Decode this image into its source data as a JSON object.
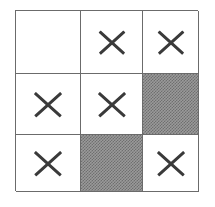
{
  "diagram": {
    "type": "grid",
    "rows": 3,
    "columns": 3,
    "colors": {
      "background": "#ffffff",
      "grid_line": "#6b6b6b",
      "cell_fill": "#ffffff",
      "shaded_fill": "#9a9a9a",
      "shaded_pattern": "#6f6f6f",
      "mark_color": "#3a3a3a"
    },
    "legend": {
      "empty_label": "empty",
      "cross_label": "X",
      "shaded_label": "shaded"
    },
    "cells": [
      {
        "row": 1,
        "col": 1,
        "state": "empty",
        "mark": ""
      },
      {
        "row": 1,
        "col": 2,
        "state": "cross",
        "mark": "X"
      },
      {
        "row": 1,
        "col": 3,
        "state": "cross",
        "mark": "X"
      },
      {
        "row": 2,
        "col": 1,
        "state": "cross",
        "mark": "X"
      },
      {
        "row": 2,
        "col": 2,
        "state": "cross",
        "mark": "X"
      },
      {
        "row": 2,
        "col": 3,
        "state": "shaded",
        "mark": ""
      },
      {
        "row": 3,
        "col": 1,
        "state": "cross",
        "mark": "X"
      },
      {
        "row": 3,
        "col": 2,
        "state": "shaded",
        "mark": ""
      },
      {
        "row": 3,
        "col": 3,
        "state": "cross",
        "mark": "X"
      }
    ],
    "counts": {
      "empty": 1,
      "cross": 6,
      "shaded": 2
    }
  }
}
